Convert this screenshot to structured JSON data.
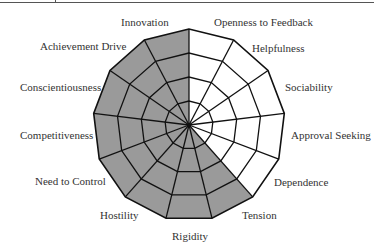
{
  "diagram": {
    "type": "circumplex-wheel",
    "segments": 13,
    "rings": 4,
    "colors": {
      "shaded_fill": "#9a9a9a",
      "unshaded_fill": "#ffffff",
      "line": "#111111",
      "text": "#333333"
    },
    "sectors": [
      {
        "label": "Innovation",
        "shaded": true
      },
      {
        "label": "Achievement Drive",
        "shaded": true
      },
      {
        "label": "Conscientiousness",
        "shaded": true
      },
      {
        "label": "Competitiveness",
        "shaded": true
      },
      {
        "label": "Need to Control",
        "shaded": true
      },
      {
        "label": "Hostility",
        "shaded": true
      },
      {
        "label": "Rigidity",
        "shaded": true
      },
      {
        "label": "Tension",
        "shaded": true
      },
      {
        "label": "Dependence",
        "shaded": false
      },
      {
        "label": "Approval Seeking",
        "shaded": false
      },
      {
        "label": "Sociability",
        "shaded": false
      },
      {
        "label": "Helpfulness",
        "shaded": false
      },
      {
        "label": "Openness to Feedback",
        "shaded": false
      }
    ]
  }
}
